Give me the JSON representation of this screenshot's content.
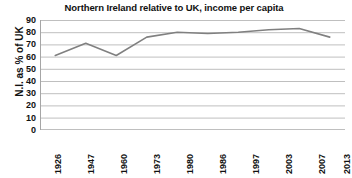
{
  "chart_data": {
    "type": "line",
    "title": "Northern Ireland relative to UK, income per capita",
    "xlabel": "",
    "ylabel": "N.I. as % of UK",
    "categories": [
      "1926",
      "1947",
      "1960",
      "1973",
      "1980",
      "1986",
      "1997",
      "2003",
      "2007",
      "2013"
    ],
    "values": [
      61,
      71,
      61,
      76,
      80,
      79,
      80,
      82,
      83,
      76
    ],
    "series": [
      {
        "name": "N.I. as % of UK",
        "values": [
          61,
          71,
          61,
          76,
          80,
          79,
          80,
          82,
          83,
          76
        ]
      }
    ],
    "ylim": [
      0,
      90
    ],
    "ytick_labels": [
      "90",
      "80",
      "70",
      "60",
      "50",
      "40",
      "30",
      "20",
      "10",
      "0"
    ],
    "ytick_values": [
      90,
      80,
      70,
      60,
      50,
      40,
      30,
      20,
      10,
      0
    ],
    "grid": true,
    "grid_axis": "y",
    "legend": false,
    "legend_position": "none",
    "line_color": "#808080",
    "grid_color": "#BFBFBF",
    "axis_color": "#A6A6A6",
    "text_color": "#111111",
    "background_color": "#FFFFFF",
    "markers": false,
    "xtick_rotation": -90
  }
}
